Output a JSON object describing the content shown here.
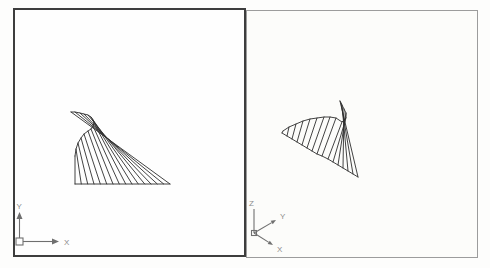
{
  "viewports": [
    {
      "label": "plan-view",
      "ucs": {
        "x_label": "X",
        "y_label": "Y"
      },
      "surface": {
        "base_rail": [
          [
            75,
            184
          ],
          [
            81.3,
            184
          ],
          [
            87.7,
            184
          ],
          [
            94,
            184
          ],
          [
            100.3,
            184
          ],
          [
            106.7,
            184
          ],
          [
            113,
            184
          ],
          [
            119.3,
            184
          ],
          [
            125.7,
            184
          ],
          [
            132,
            184
          ],
          [
            138.3,
            184
          ],
          [
            144.7,
            184
          ],
          [
            151,
            184
          ],
          [
            157.3,
            184
          ],
          [
            163.7,
            184
          ],
          [
            170,
            184
          ]
        ],
        "curve_rail": [
          [
            75,
            156
          ],
          [
            76,
            149
          ],
          [
            78,
            143
          ],
          [
            81,
            138
          ],
          [
            84,
            134
          ],
          [
            88,
            131
          ],
          [
            91,
            129
          ],
          [
            93,
            126
          ],
          [
            94,
            123
          ],
          [
            93,
            120
          ],
          [
            91,
            117
          ],
          [
            88,
            115
          ],
          [
            84,
            114
          ],
          [
            80,
            113
          ],
          [
            75,
            112
          ],
          [
            71,
            112
          ]
        ]
      }
    },
    {
      "label": "iso-view",
      "ucs": {
        "x_label": "X",
        "y_label": "Y",
        "z_label": "Z"
      },
      "surface": {
        "base_rail": [
          [
            282,
            133
          ],
          [
            287,
            136
          ],
          [
            292,
            139
          ],
          [
            297,
            142
          ],
          [
            302,
            145
          ],
          [
            307,
            148
          ],
          [
            312,
            151
          ],
          [
            317,
            154
          ],
          [
            322,
            156
          ],
          [
            328,
            159
          ],
          [
            333,
            162
          ],
          [
            338,
            165
          ],
          [
            343,
            168
          ],
          [
            348,
            171
          ],
          [
            353,
            174
          ],
          [
            358,
            177
          ]
        ],
        "curve_rail": [
          [
            283,
            131
          ],
          [
            289,
            127
          ],
          [
            296,
            124
          ],
          [
            303,
            121
          ],
          [
            310,
            119
          ],
          [
            317,
            118
          ],
          [
            324,
            117
          ],
          [
            330,
            117
          ],
          [
            336,
            118
          ],
          [
            342,
            122
          ],
          [
            346,
            118
          ],
          [
            346,
            113
          ],
          [
            344,
            109
          ],
          [
            342,
            105
          ],
          [
            341,
            103
          ],
          [
            340,
            101
          ]
        ]
      }
    }
  ],
  "colors": {
    "line": "#2e2e2e",
    "active_viewport_border": "#3d3d3d",
    "inactive_viewport_border": "#9c9c9c",
    "ucs_icon": "#6f6f6f",
    "background": "#fdfdfc"
  }
}
